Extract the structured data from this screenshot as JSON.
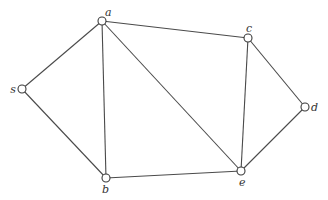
{
  "diagram": {
    "type": "undirected-graph",
    "nodes": [
      {
        "id": "a",
        "label": "a",
        "x": 102,
        "y": 21,
        "lx": 105,
        "ly": 16,
        "anchor": "start"
      },
      {
        "id": "c",
        "label": "c",
        "x": 248,
        "y": 38,
        "lx": 246,
        "ly": 32,
        "anchor": "start"
      },
      {
        "id": "s",
        "label": "s",
        "x": 22,
        "y": 89,
        "lx": 16,
        "ly": 93,
        "anchor": "end"
      },
      {
        "id": "b",
        "label": "b",
        "x": 106,
        "y": 178,
        "lx": 102,
        "ly": 193,
        "anchor": "start"
      },
      {
        "id": "e",
        "label": "e",
        "x": 241,
        "y": 171,
        "lx": 239,
        "ly": 186,
        "anchor": "start"
      },
      {
        "id": "d",
        "label": "d",
        "x": 305,
        "y": 107,
        "lx": 311,
        "ly": 111,
        "anchor": "start"
      }
    ],
    "edges": [
      {
        "from": "s",
        "to": "a"
      },
      {
        "from": "s",
        "to": "b"
      },
      {
        "from": "a",
        "to": "b"
      },
      {
        "from": "a",
        "to": "c"
      },
      {
        "from": "a",
        "to": "e"
      },
      {
        "from": "c",
        "to": "e"
      },
      {
        "from": "c",
        "to": "d"
      },
      {
        "from": "b",
        "to": "e"
      },
      {
        "from": "e",
        "to": "d"
      }
    ],
    "node_radius": 4
  }
}
